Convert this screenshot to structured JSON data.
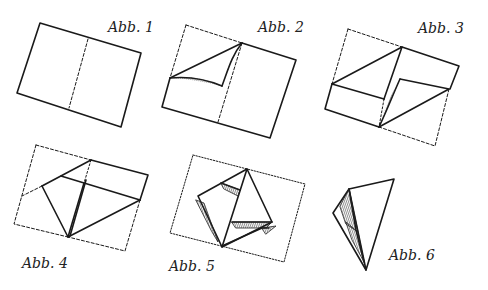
{
  "colors": {
    "ink": "#1a1a1a",
    "paper": "#ffffff",
    "shade": "#555555"
  },
  "figures": [
    {
      "id": 1,
      "label": "Abb. 1"
    },
    {
      "id": 2,
      "label": "Abb. 2"
    },
    {
      "id": 3,
      "label": "Abb. 3"
    },
    {
      "id": 4,
      "label": "Abb. 4"
    },
    {
      "id": 5,
      "label": "Abb. 5"
    },
    {
      "id": 6,
      "label": "Abb. 6"
    }
  ]
}
